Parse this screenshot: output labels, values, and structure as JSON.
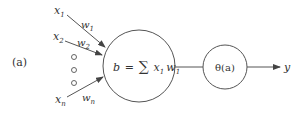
{
  "figure": {
    "panel_label": "(a)",
    "inputs": [
      {
        "name": "x",
        "sub": "1",
        "weight": "w",
        "weight_sub": "1"
      },
      {
        "name": "x",
        "sub": "2",
        "weight": "w",
        "weight_sub": "2"
      },
      {
        "name": "x",
        "sub": "n",
        "weight": "w",
        "weight_sub": "n"
      }
    ],
    "ellipsis": "o o o",
    "summation_node": {
      "lhs": "b",
      "eq": "=",
      "sigma": "∑",
      "term_x": "x",
      "term_x_sub": "1",
      "term_w": "w",
      "term_w_sub": "1"
    },
    "activation_node": {
      "label": "θ(a)"
    },
    "output": {
      "label": "y"
    },
    "stroke_color": "#555555"
  }
}
